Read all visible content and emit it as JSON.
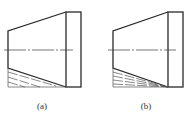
{
  "figures": [
    {
      "id": "a",
      "caption": "(a)",
      "description": "Tapered shaft with chamfer hidden lines parallel to taper",
      "label_x": 27
    },
    {
      "id": "b",
      "caption": "(b)",
      "description": "Tapered shaft with hidden lines converging to corner",
      "label_x": 131
    }
  ],
  "colors": {
    "stroke": "#2a2a2a",
    "centerline": "#3a3a3a",
    "hidden": "#555555",
    "background": "#ffffff"
  }
}
